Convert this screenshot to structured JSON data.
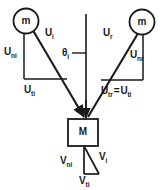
{
  "figure": {
    "stroke_color": "#1a1a1a",
    "background_color": "#ffffff"
  },
  "bodies": {
    "incoming_mass_label": "m",
    "rebound_mass_label": "m",
    "target_mass_label": "M"
  },
  "labels": {
    "u_incident": {
      "symbol": "U",
      "subscript": "i"
    },
    "u_rebound": {
      "symbol": "U",
      "subscript": "r"
    },
    "un_incident": {
      "symbol": "U",
      "subscript": "n",
      "subscript2": "i"
    },
    "un_rebound": {
      "symbol": "U",
      "subscript": "n",
      "subscript2": "r"
    },
    "ut_incident": {
      "symbol": "U",
      "subscript": "t",
      "subscript2": "i"
    },
    "ut_equality": {
      "symbol": "U",
      "subscript": "t",
      "subscript2": "r",
      "relation": "=",
      "symbol_b": "U",
      "subscript_b": "t",
      "subscript2_b": "i"
    },
    "theta_incident": {
      "symbol": "θ",
      "subscript": "i"
    },
    "v_resultant": {
      "symbol": "V",
      "subscript": "i"
    },
    "vn_normal": {
      "symbol": "V",
      "subscript": "n",
      "subscript2": "i"
    },
    "vt_tangential": {
      "symbol": "V",
      "subscript": "t",
      "subscript2": "i"
    }
  },
  "text": {
    "u_i": "U",
    "u_i_sub": "i",
    "u_r": "U",
    "u_r_sub": "r",
    "un_i": "U",
    "un_i_sub": "n",
    "un_i_sub2": "i",
    "un_r": "U",
    "un_r_sub": "n",
    "un_r_sub2": "r",
    "ut_i": "U",
    "ut_i_sub": "t",
    "ut_i_sub2": "i",
    "ut_eq_a": "U",
    "ut_eq_a_sub": "t",
    "ut_eq_a_sub2": "r",
    "ut_eq_rel": "=",
    "ut_eq_b": "U",
    "ut_eq_b_sub": "t",
    "ut_eq_b_sub2": "i",
    "theta": "θ",
    "theta_sub": "i",
    "v_i": "V",
    "v_i_sub": "i",
    "vn_i": "V",
    "vn_i_sub": "n",
    "vn_i_sub2": "i",
    "vt_i": "V",
    "vt_i_sub": "t",
    "vt_i_sub2": "i",
    "mass_m_left": "m",
    "mass_m_right": "m",
    "mass_M": "M"
  }
}
